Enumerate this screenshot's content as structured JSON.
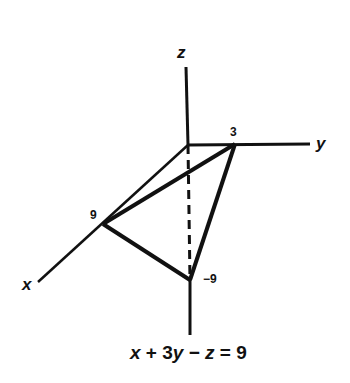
{
  "diagram": {
    "type": "3d-plane-intercepts",
    "axes": {
      "x_label": "x",
      "y_label": "y",
      "z_label": "z"
    },
    "intercepts": {
      "x": "9",
      "y": "3",
      "z": "−9"
    },
    "equation": {
      "full": "x + 3y − z = 9",
      "parts": [
        "x",
        " + 3",
        "y",
        " − ",
        "z",
        " = 9"
      ]
    },
    "colors": {
      "ink": "#111111",
      "background": "#ffffff"
    }
  }
}
